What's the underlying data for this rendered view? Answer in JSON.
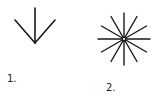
{
  "figures": [
    {
      "id": "figure-1",
      "label": "1.",
      "shape": "arrow-down-three-lines"
    },
    {
      "id": "figure-2",
      "label": "2.",
      "shape": "starburst-radiating-lines",
      "ray_count": 12
    }
  ],
  "colors": {
    "stroke": "#1a1a1a",
    "background": "#ffffff"
  }
}
